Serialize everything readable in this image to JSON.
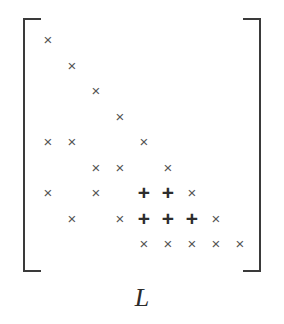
{
  "figure": {
    "label": "L",
    "caption_label": "L",
    "symbols": {
      "nonzero": "×",
      "fillin": "+"
    },
    "colors": {
      "background": "#ffffff",
      "bracket": "#3a3a3a",
      "nonzero_mark": "#555555",
      "fillin_mark": "#2d2d2d",
      "label": "#2b2b2b"
    },
    "brackets": {
      "left": "[",
      "right": "]"
    }
  },
  "chart_data": {
    "type": "heatmap",
    "title": "L",
    "xlabel": "",
    "ylabel": "",
    "rows": 9,
    "cols": 9,
    "legend": [
      {
        "symbol": "×",
        "name": "original-nonzero"
      },
      {
        "symbol": "+",
        "name": "fill-in"
      }
    ],
    "cells": [
      {
        "row": 1,
        "col": 1,
        "symbol": "×"
      },
      {
        "row": 2,
        "col": 2,
        "symbol": "×"
      },
      {
        "row": 3,
        "col": 3,
        "symbol": "×"
      },
      {
        "row": 4,
        "col": 4,
        "symbol": "×"
      },
      {
        "row": 5,
        "col": 1,
        "symbol": "×"
      },
      {
        "row": 5,
        "col": 2,
        "symbol": "×"
      },
      {
        "row": 5,
        "col": 5,
        "symbol": "×"
      },
      {
        "row": 6,
        "col": 3,
        "symbol": "×"
      },
      {
        "row": 6,
        "col": 4,
        "symbol": "×"
      },
      {
        "row": 6,
        "col": 6,
        "symbol": "×"
      },
      {
        "row": 7,
        "col": 1,
        "symbol": "×"
      },
      {
        "row": 7,
        "col": 3,
        "symbol": "×"
      },
      {
        "row": 7,
        "col": 5,
        "symbol": "+"
      },
      {
        "row": 7,
        "col": 6,
        "symbol": "+"
      },
      {
        "row": 7,
        "col": 7,
        "symbol": "×"
      },
      {
        "row": 8,
        "col": 2,
        "symbol": "×"
      },
      {
        "row": 8,
        "col": 4,
        "symbol": "×"
      },
      {
        "row": 8,
        "col": 5,
        "symbol": "+"
      },
      {
        "row": 8,
        "col": 6,
        "symbol": "+"
      },
      {
        "row": 8,
        "col": 7,
        "symbol": "+"
      },
      {
        "row": 8,
        "col": 8,
        "symbol": "×"
      },
      {
        "row": 9,
        "col": 5,
        "symbol": "×"
      },
      {
        "row": 9,
        "col": 6,
        "symbol": "×"
      },
      {
        "row": 9,
        "col": 7,
        "symbol": "×"
      },
      {
        "row": 9,
        "col": 8,
        "symbol": "×"
      },
      {
        "row": 9,
        "col": 9,
        "symbol": "×"
      }
    ]
  }
}
